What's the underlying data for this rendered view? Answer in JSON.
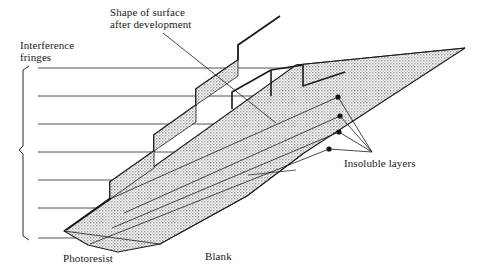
{
  "figure": {
    "type": "technical-diagram",
    "title_in_image": null,
    "labels": {
      "shape_of_surface": "Shape of surface\nafter development",
      "interference_fringes": "Interference\nfringes",
      "insoluble_layers": "Insoluble layers",
      "photoresist": "Photoresist",
      "blank": "Blank"
    },
    "colors": {
      "ink": "#1a1a1a",
      "stipple_fill": "#d8d8d8",
      "stipple_dot": "#6e6e6e",
      "fringe_line": "#3a3a3a",
      "background": "#ffffff"
    },
    "counts": {
      "interference_fringes": 7,
      "steps": 6,
      "insoluble_layer_callout_dots": 4
    },
    "fringe_lines_y": [
      68,
      96,
      124,
      152,
      180,
      208,
      238
    ],
    "fringe_line_x_start": 38,
    "bracket": {
      "x": 22,
      "y_top": 66,
      "y_bottom": 240,
      "tick_y": 150
    },
    "leader_lines": {
      "shape_of_surface": {
        "from_x": 163,
        "from_y": 32,
        "to_x": 272,
        "to_y": 118
      },
      "insoluble_layers_apex": {
        "x": 341,
        "y": 152
      },
      "dots": [
        {
          "x": 338,
          "y": 97
        },
        {
          "x": 340,
          "y": 116
        },
        {
          "x": 339,
          "y": 132
        },
        {
          "x": 329,
          "y": 149
        }
      ]
    }
  }
}
